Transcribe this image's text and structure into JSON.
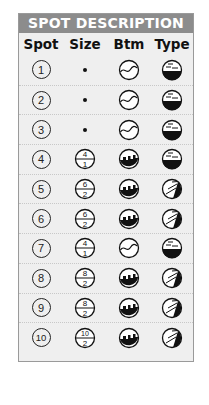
{
  "title": "SPOT DESCRIPTION",
  "columns": [
    "Spot",
    "Size",
    "Btm",
    "Type"
  ],
  "rows": [
    {
      "spot": "1",
      "size": null,
      "size_icon": "dot",
      "bottom": "wave",
      "type": "horizontal-lines"
    },
    {
      "spot": "2",
      "size": null,
      "size_icon": "dot",
      "bottom": "wave",
      "type": "horizontal-lines"
    },
    {
      "spot": "3",
      "size": null,
      "size_icon": "dot",
      "bottom": "wave",
      "type": "horizontal-lines"
    },
    {
      "spot": "4",
      "size": {
        "top": "4",
        "bottom": "1"
      },
      "size_icon": "fraction",
      "bottom": "reef",
      "type": "horizontal-lines"
    },
    {
      "spot": "5",
      "size": {
        "top": "6",
        "bottom": "2"
      },
      "size_icon": "fraction",
      "bottom": "reef",
      "type": "diagonal-lines"
    },
    {
      "spot": "6",
      "size": {
        "top": "6",
        "bottom": "2"
      },
      "size_icon": "fraction",
      "bottom": "reef",
      "type": "diagonal-lines"
    },
    {
      "spot": "7",
      "size": {
        "top": "4",
        "bottom": "1"
      },
      "size_icon": "fraction",
      "bottom": "wave",
      "type": "horizontal-lines"
    },
    {
      "spot": "8",
      "size": {
        "top": "8",
        "bottom": "2"
      },
      "size_icon": "fraction",
      "bottom": "reef",
      "type": "diagonal-lines"
    },
    {
      "spot": "9",
      "size": {
        "top": "8",
        "bottom": "2"
      },
      "size_icon": "fraction",
      "bottom": "reef",
      "type": "diagonal-lines"
    },
    {
      "spot": "10",
      "size": {
        "top": "10",
        "bottom": "2"
      },
      "size_icon": "fraction",
      "bottom": "reef",
      "type": "diagonal-lines"
    }
  ],
  "colors": {
    "header_bg": "#8c8c8c",
    "panel_bg": "#efefef",
    "ink": "#111111"
  }
}
